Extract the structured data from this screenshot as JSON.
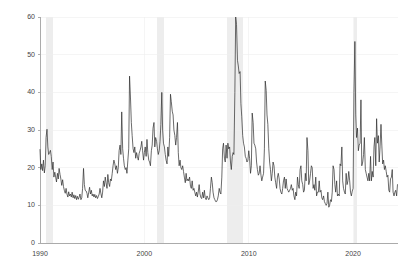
{
  "chart_data": {
    "type": "line",
    "title": "",
    "subtitle": "",
    "xlabel": "",
    "ylabel": "",
    "xlim": [
      1990.0,
      2024.3
    ],
    "ylim": [
      0,
      60
    ],
    "grid": true,
    "legend": "none",
    "line_color": "#2b2b2b",
    "line_width": 0.7,
    "axis_color": "#999999",
    "grid_color": "#eeeeee",
    "recession_band_color": "#ededed",
    "background_color": "#ffffff",
    "x_ticks": [
      1990,
      2000,
      2010,
      2020
    ],
    "x_tick_labels": [
      "1990",
      "2000",
      "2010",
      "2020"
    ],
    "y_ticks": [
      0,
      10,
      20,
      30,
      40,
      50,
      60
    ],
    "y_tick_labels": [
      "0",
      "10",
      "20",
      "30",
      "40",
      "50",
      "60"
    ],
    "recession_bands": [
      {
        "start": 1990.54,
        "end": 1991.21
      },
      {
        "start": 2001.21,
        "end": 2001.88
      },
      {
        "start": 2007.96,
        "end": 2009.46
      },
      {
        "start": 2020.13,
        "end": 2020.38
      }
    ],
    "series": [
      {
        "name": "Volatility Index",
        "x": [
          1990.0,
          1990.08,
          1990.17,
          1990.25,
          1990.33,
          1990.42,
          1990.5,
          1990.58,
          1990.67,
          1990.75,
          1990.83,
          1990.92,
          1991.0,
          1991.08,
          1991.17,
          1991.25,
          1991.33,
          1991.42,
          1991.5,
          1991.58,
          1991.67,
          1991.75,
          1991.83,
          1991.92,
          1992.0,
          1992.08,
          1992.17,
          1992.25,
          1992.33,
          1992.42,
          1992.5,
          1992.58,
          1992.67,
          1992.75,
          1992.83,
          1992.92,
          1993.0,
          1993.08,
          1993.17,
          1993.25,
          1993.33,
          1993.42,
          1993.5,
          1993.58,
          1993.67,
          1993.75,
          1993.83,
          1993.92,
          1994.0,
          1994.08,
          1994.17,
          1994.25,
          1994.33,
          1994.42,
          1994.5,
          1994.58,
          1994.67,
          1994.75,
          1994.83,
          1994.92,
          1995.0,
          1995.08,
          1995.17,
          1995.25,
          1995.33,
          1995.42,
          1995.5,
          1995.58,
          1995.67,
          1995.75,
          1995.83,
          1995.92,
          1996.0,
          1996.08,
          1996.17,
          1996.25,
          1996.33,
          1996.42,
          1996.5,
          1996.58,
          1996.67,
          1996.75,
          1996.83,
          1996.92,
          1997.0,
          1997.08,
          1997.17,
          1997.25,
          1997.33,
          1997.42,
          1997.5,
          1997.58,
          1997.67,
          1997.75,
          1997.83,
          1997.92,
          1998.0,
          1998.08,
          1998.17,
          1998.25,
          1998.33,
          1998.42,
          1998.5,
          1998.58,
          1998.67,
          1998.75,
          1998.83,
          1998.92,
          1999.0,
          1999.08,
          1999.17,
          1999.25,
          1999.33,
          1999.42,
          1999.5,
          1999.58,
          1999.67,
          1999.75,
          1999.83,
          1999.92,
          2000.0,
          2000.08,
          2000.17,
          2000.25,
          2000.33,
          2000.42,
          2000.5,
          2000.58,
          2000.67,
          2000.75,
          2000.83,
          2000.92,
          2001.0,
          2001.08,
          2001.17,
          2001.25,
          2001.33,
          2001.42,
          2001.5,
          2001.58,
          2001.67,
          2001.75,
          2001.83,
          2001.92,
          2002.0,
          2002.08,
          2002.17,
          2002.25,
          2002.33,
          2002.42,
          2002.5,
          2002.58,
          2002.67,
          2002.75,
          2002.83,
          2002.92,
          2003.0,
          2003.08,
          2003.17,
          2003.25,
          2003.33,
          2003.42,
          2003.5,
          2003.58,
          2003.67,
          2003.75,
          2003.83,
          2003.92,
          2004.0,
          2004.08,
          2004.17,
          2004.25,
          2004.33,
          2004.42,
          2004.5,
          2004.58,
          2004.67,
          2004.75,
          2004.83,
          2004.92,
          2005.0,
          2005.08,
          2005.17,
          2005.25,
          2005.33,
          2005.42,
          2005.5,
          2005.58,
          2005.67,
          2005.75,
          2005.83,
          2005.92,
          2006.0,
          2006.08,
          2006.17,
          2006.25,
          2006.33,
          2006.42,
          2006.5,
          2006.58,
          2006.67,
          2006.75,
          2006.83,
          2006.92,
          2007.0,
          2007.08,
          2007.17,
          2007.25,
          2007.33,
          2007.42,
          2007.5,
          2007.58,
          2007.67,
          2007.75,
          2007.83,
          2007.92,
          2008.0,
          2008.08,
          2008.17,
          2008.25,
          2008.33,
          2008.42,
          2008.5,
          2008.58,
          2008.67,
          2008.75,
          2008.83,
          2008.92,
          2009.0,
          2009.08,
          2009.17,
          2009.25,
          2009.33,
          2009.42,
          2009.5,
          2009.58,
          2009.67,
          2009.75,
          2009.83,
          2009.92,
          2010.0,
          2010.08,
          2010.17,
          2010.25,
          2010.33,
          2010.42,
          2010.5,
          2010.58,
          2010.67,
          2010.75,
          2010.83,
          2010.92,
          2011.0,
          2011.08,
          2011.17,
          2011.25,
          2011.33,
          2011.42,
          2011.5,
          2011.58,
          2011.67,
          2011.75,
          2011.83,
          2011.92,
          2012.0,
          2012.08,
          2012.17,
          2012.25,
          2012.33,
          2012.42,
          2012.5,
          2012.58,
          2012.67,
          2012.75,
          2012.83,
          2012.92,
          2013.0,
          2013.08,
          2013.17,
          2013.25,
          2013.33,
          2013.42,
          2013.5,
          2013.58,
          2013.67,
          2013.75,
          2013.83,
          2013.92,
          2014.0,
          2014.08,
          2014.17,
          2014.25,
          2014.33,
          2014.42,
          2014.5,
          2014.58,
          2014.67,
          2014.75,
          2014.83,
          2014.92,
          2015.0,
          2015.08,
          2015.17,
          2015.25,
          2015.33,
          2015.42,
          2015.5,
          2015.58,
          2015.67,
          2015.75,
          2015.83,
          2015.92,
          2016.0,
          2016.08,
          2016.17,
          2016.25,
          2016.33,
          2016.42,
          2016.5,
          2016.58,
          2016.67,
          2016.75,
          2016.83,
          2016.92,
          2017.0,
          2017.08,
          2017.17,
          2017.25,
          2017.33,
          2017.42,
          2017.5,
          2017.58,
          2017.67,
          2017.75,
          2017.83,
          2017.92,
          2018.0,
          2018.08,
          2018.17,
          2018.25,
          2018.33,
          2018.42,
          2018.5,
          2018.58,
          2018.67,
          2018.75,
          2018.83,
          2018.92,
          2019.0,
          2019.08,
          2019.17,
          2019.25,
          2019.33,
          2019.42,
          2019.5,
          2019.58,
          2019.67,
          2019.75,
          2019.83,
          2019.92,
          2020.0,
          2020.08,
          2020.17,
          2020.25,
          2020.33,
          2020.42,
          2020.5,
          2020.58,
          2020.67,
          2020.75,
          2020.83,
          2020.92,
          2021.0,
          2021.08,
          2021.17,
          2021.25,
          2021.33,
          2021.42,
          2021.5,
          2021.58,
          2021.67,
          2021.75,
          2021.83,
          2021.92,
          2022.0,
          2022.08,
          2022.17,
          2022.25,
          2022.33,
          2022.42,
          2022.5,
          2022.58,
          2022.67,
          2022.75,
          2022.83,
          2022.92,
          2023.0,
          2023.08,
          2023.17,
          2023.25,
          2023.33,
          2023.42,
          2023.5,
          2023.58,
          2023.67,
          2023.75,
          2023.83,
          2023.92,
          2024.0,
          2024.08,
          2024.17,
          2024.25
        ],
        "values": [
          24.8,
          19.5,
          21.0,
          19.2,
          22.0,
          18.6,
          20.5,
          28.0,
          30.2,
          25.5,
          23.5,
          24.0,
          24.6,
          23.0,
          19.5,
          21.5,
          17.5,
          18.8,
          17.5,
          16.2,
          18.5,
          17.0,
          19.8,
          18.2,
          17.0,
          15.3,
          16.8,
          15.0,
          14.0,
          13.2,
          14.5,
          13.0,
          12.2,
          13.6,
          12.5,
          13.0,
          12.2,
          13.5,
          12.0,
          12.8,
          11.8,
          12.6,
          11.5,
          12.4,
          11.6,
          12.2,
          13.0,
          11.5,
          12.0,
          14.5,
          19.8,
          15.5,
          14.0,
          13.8,
          13.2,
          12.0,
          13.5,
          14.8,
          13.0,
          14.0,
          12.5,
          13.0,
          12.2,
          12.9,
          12.0,
          12.6,
          11.8,
          12.3,
          13.0,
          14.5,
          13.2,
          12.0,
          13.5,
          16.5,
          15.0,
          17.5,
          16.0,
          14.5,
          18.2,
          16.0,
          15.0,
          17.0,
          16.5,
          18.5,
          20.5,
          22.0,
          21.0,
          19.5,
          20.5,
          18.5,
          20.0,
          24.5,
          26.0,
          23.5,
          34.8,
          25.0,
          22.5,
          20.5,
          19.5,
          20.0,
          18.5,
          22.0,
          25.0,
          44.3,
          38.5,
          32.0,
          28.5,
          25.0,
          24.0,
          25.5,
          22.5,
          24.0,
          23.0,
          22.0,
          23.8,
          24.5,
          25.5,
          27.0,
          24.5,
          22.0,
          24.0,
          25.5,
          23.0,
          27.5,
          24.0,
          22.0,
          21.5,
          20.5,
          24.5,
          26.0,
          30.5,
          32.0,
          25.5,
          28.0,
          27.0,
          25.0,
          23.5,
          24.5,
          27.0,
          31.5,
          40.0,
          30.0,
          26.5,
          25.5,
          23.5,
          22.0,
          21.0,
          25.5,
          23.0,
          28.0,
          39.5,
          37.5,
          35.0,
          34.0,
          30.0,
          28.5,
          26.0,
          28.0,
          32.0,
          24.0,
          20.5,
          22.0,
          20.0,
          19.5,
          20.5,
          19.0,
          17.5,
          16.0,
          18.5,
          16.5,
          17.0,
          16.5,
          17.5,
          15.0,
          14.5,
          16.5,
          14.0,
          14.5,
          13.5,
          12.5,
          13.5,
          12.2,
          13.8,
          15.5,
          13.0,
          12.0,
          11.8,
          13.5,
          12.0,
          14.0,
          12.0,
          11.5,
          12.5,
          12.0,
          11.5,
          12.0,
          14.5,
          17.5,
          16.0,
          13.5,
          12.0,
          11.5,
          11.0,
          11.0,
          11.5,
          12.5,
          14.5,
          13.5,
          13.0,
          17.5,
          25.0,
          26.5,
          22.5,
          21.5,
          26.0,
          22.5,
          26.5,
          25.0,
          25.5,
          21.5,
          19.5,
          23.0,
          24.0,
          23.5,
          40.0,
          60.0,
          58.0,
          48.5,
          47.0,
          45.0,
          45.5,
          37.0,
          33.5,
          28.5,
          26.5,
          25.5,
          23.0,
          22.5,
          21.5,
          22.0,
          24.5,
          22.5,
          18.5,
          20.5,
          34.5,
          32.0,
          26.5,
          26.0,
          25.0,
          21.5,
          19.5,
          18.0,
          18.5,
          20.5,
          18.0,
          16.5,
          17.5,
          18.5,
          25.0,
          43.0,
          40.5,
          34.0,
          31.5,
          25.0,
          21.5,
          19.5,
          16.5,
          18.5,
          21.5,
          20.5,
          17.5,
          16.0,
          14.5,
          17.5,
          18.5,
          17.0,
          14.5,
          13.5,
          13.0,
          14.5,
          16.5,
          17.5,
          14.5,
          17.0,
          14.5,
          14.0,
          13.5,
          14.0,
          14.5,
          15.5,
          14.0,
          14.5,
          12.5,
          11.5,
          13.5,
          12.5,
          17.5,
          15.5,
          14.5,
          19.5,
          20.5,
          16.5,
          15.5,
          13.5,
          14.0,
          18.5,
          16.5,
          28.0,
          24.5,
          15.5,
          16.5,
          18.5,
          20.5,
          20.0,
          14.5,
          15.5,
          14.0,
          17.5,
          12.5,
          13.5,
          13.5,
          16.5,
          13.5,
          14.0,
          12.0,
          11.5,
          12.5,
          11.0,
          10.5,
          10.0,
          10.5,
          13.5,
          9.5,
          10.0,
          11.5,
          11.0,
          13.5,
          20.5,
          19.5,
          15.5,
          13.5,
          16.5,
          12.5,
          13.0,
          12.5,
          21.0,
          20.5,
          25.5,
          16.5,
          14.5,
          13.5,
          13.0,
          18.5,
          15.5,
          16.5,
          19.0,
          16.5,
          13.5,
          12.5,
          13.8,
          14.5,
          40.0,
          53.5,
          34.0,
          28.0,
          30.5,
          24.5,
          26.0,
          26.5,
          38.0,
          20.5,
          21.5,
          23.5,
          28.0,
          19.5,
          18.5,
          17.5,
          16.5,
          18.5,
          16.5,
          23.0,
          16.5,
          19.0,
          17.5,
          25.5,
          28.0,
          20.5,
          33.0,
          26.5,
          28.5,
          21.5,
          25.5,
          31.5,
          26.0,
          21.0,
          22.0,
          19.5,
          20.5,
          19.0,
          17.5,
          18.0,
          14.0,
          13.5,
          17.0,
          17.5,
          19.5,
          13.5,
          12.5,
          13.5,
          14.0,
          12.5,
          15.5
        ]
      }
    ]
  }
}
